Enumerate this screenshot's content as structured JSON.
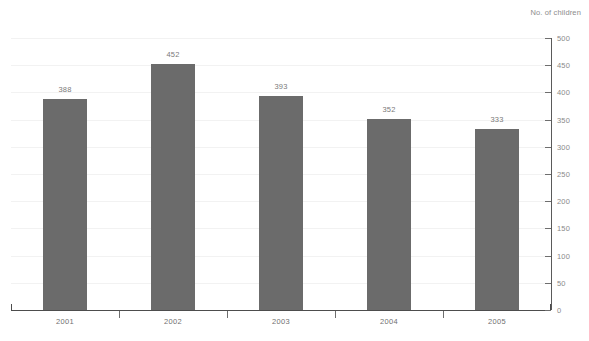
{
  "chart_data": {
    "type": "bar",
    "title": "",
    "subtitle": "",
    "xlabel": "",
    "ylabel": "No. of children",
    "ylabel_position": "top-right",
    "axis_side": "right",
    "grid": true,
    "legend": null,
    "categories": [
      "2001",
      "2002",
      "2003",
      "2004",
      "2005"
    ],
    "values": [
      388,
      452,
      393,
      352,
      333
    ],
    "data_labels": [
      "388",
      "452",
      "393",
      "352",
      "333"
    ],
    "ylim": [
      0,
      500
    ],
    "ytick_step": 50,
    "ytick_labels": [
      "500",
      "450",
      "400",
      "350",
      "300",
      "250",
      "200",
      "150",
      "100",
      "50",
      "0"
    ],
    "ytick_values": [
      500,
      450,
      400,
      350,
      300,
      250,
      200,
      150,
      100,
      50,
      0
    ],
    "colors": {
      "bar": "#6b6b6b",
      "axis": "#4d4d4d",
      "tick": "#6e6e6e",
      "grid": "#f2f2f2",
      "label_text": "#7a7a7a",
      "tick_text": "#8a8a8a",
      "background": "#ffffff"
    }
  }
}
